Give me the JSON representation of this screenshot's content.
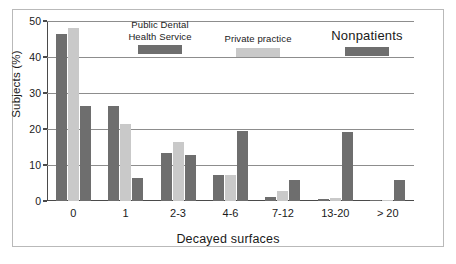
{
  "chart_data": {
    "type": "bar",
    "title": "",
    "xlabel": "Decayed surfaces",
    "ylabel": "Subjects (%)",
    "categories": [
      "0",
      "1",
      "2-3",
      "4-6",
      "7-12",
      "13-20",
      "> 20"
    ],
    "series": [
      {
        "name": "Public Dental Health Service",
        "color": "#6e6e6e",
        "values": [
          46.5,
          26.3,
          13.2,
          7.3,
          1.1,
          0.6,
          0.4
        ]
      },
      {
        "name": "Private practice",
        "color": "#c9c9c9",
        "values": [
          48.0,
          21.3,
          16.3,
          7.2,
          2.7,
          0.8,
          0.3
        ]
      },
      {
        "name": "Nonpatients",
        "color": "#6e6e6e",
        "values": [
          26.3,
          6.4,
          12.7,
          19.5,
          5.8,
          19.3,
          5.7
        ]
      }
    ],
    "ylim": [
      0,
      50
    ],
    "yticks": [
      0,
      10,
      20,
      30,
      40,
      50
    ],
    "ytick_labels": [
      "0",
      "10",
      "20",
      "30",
      "40",
      "50"
    ],
    "grid": "horizontal",
    "legend_position": "top-inside"
  },
  "legend": {
    "pdhs_label": "Public Dental\nHealth Service",
    "private_label": "Private practice",
    "nonpatients_label": "Nonpatients"
  }
}
